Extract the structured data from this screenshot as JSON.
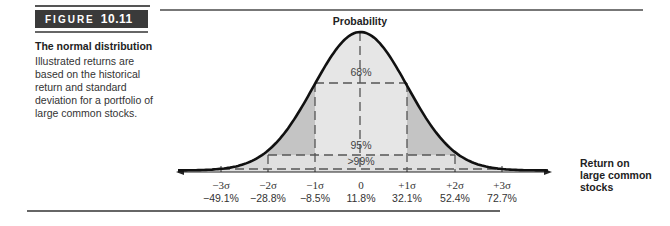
{
  "figure": {
    "label_word": "FIGURE",
    "label_number": "10.11",
    "title": "The normal distribution",
    "caption": "Illustrated returns are based on the historical return and standard deviation for a portfolio of large common stocks."
  },
  "chart_data": {
    "type": "area",
    "title": "The normal distribution",
    "ylabel": "Probability",
    "xlabel": "Return on large common stocks",
    "grid": false,
    "legend": null,
    "mean_return_pct": 11.8,
    "std_dev_pct": 20.3,
    "ticks": [
      {
        "sigma": "−3σ",
        "return": "−49.1%",
        "value": -49.1
      },
      {
        "sigma": "−2σ",
        "return": "−28.8%",
        "value": -28.8
      },
      {
        "sigma": "−1σ",
        "return": "−8.5%",
        "value": -8.5
      },
      {
        "sigma": "0",
        "return": "11.8%",
        "value": 11.8
      },
      {
        "sigma": "+1σ",
        "return": "32.1%",
        "value": 32.1
      },
      {
        "sigma": "+2σ",
        "return": "52.4%",
        "value": 52.4
      },
      {
        "sigma": "+3σ",
        "return": "72.7%",
        "value": 72.7
      }
    ],
    "regions": [
      {
        "label": "68%",
        "range_sigma": [
          -1,
          1
        ],
        "shade": "#e6e6e6"
      },
      {
        "label": "95%",
        "range_sigma": [
          -2,
          2
        ],
        "shade": "#c8c8c8"
      },
      {
        "label": ">99%",
        "range_sigma": [
          -3,
          3
        ],
        "shade": "#d9d9d9"
      }
    ]
  },
  "labels": {
    "y_axis": "Probability",
    "x_axis_line1": "Return on",
    "x_axis_line2": "large common",
    "x_axis_line3": "stocks",
    "pct68": "68%",
    "pct95": "95%",
    "pct99": ">99%",
    "t0_sigma": "−3σ",
    "t0_ret": "−49.1%",
    "t1_sigma": "−2σ",
    "t1_ret": "−28.8%",
    "t2_sigma": "−1σ",
    "t2_ret": "−8.5%",
    "t3_sigma": "0",
    "t3_ret": "11.8%",
    "t4_sigma": "+1σ",
    "t4_ret": "32.1%",
    "t5_sigma": "+2σ",
    "t5_ret": "52.4%",
    "t6_sigma": "+3σ",
    "t6_ret": "72.7%"
  }
}
